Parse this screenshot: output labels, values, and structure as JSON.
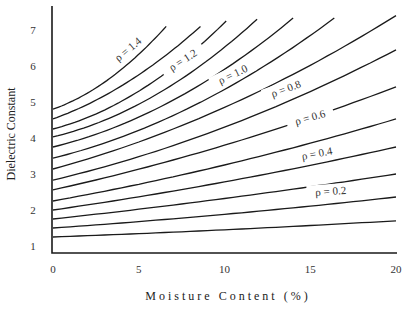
{
  "chart_data": {
    "type": "line",
    "title": "",
    "xlabel": "Moisture Content (%)",
    "ylabel": "Dielectric Constant",
    "xlim": [
      0,
      20
    ],
    "ylim": [
      1,
      7.5
    ],
    "x_ticks": [
      0,
      5,
      10,
      15,
      20
    ],
    "y_ticks": [
      1,
      2,
      3,
      4,
      5,
      6,
      7
    ],
    "grid": false,
    "legend": "none (curves labeled inline)",
    "series": [
      {
        "name": "ρ = 1.4",
        "labeled": true,
        "points": [
          [
            0,
            4.8
          ],
          [
            3,
            5.55
          ],
          [
            6.6,
            7.1
          ]
        ]
      },
      {
        "name": "ρ = 1.3",
        "labeled": false,
        "points": [
          [
            0,
            4.53
          ],
          [
            4,
            5.45
          ],
          [
            8.6,
            7.1
          ]
        ]
      },
      {
        "name": "ρ = 1.2",
        "labeled": true,
        "points": [
          [
            0,
            4.25
          ],
          [
            5,
            5.3
          ],
          [
            10.1,
            7.25
          ]
        ]
      },
      {
        "name": "ρ = 1.1",
        "labeled": false,
        "points": [
          [
            0,
            4.03
          ],
          [
            6,
            5.2
          ],
          [
            11.9,
            7.3
          ]
        ]
      },
      {
        "name": "ρ = 1.0",
        "labeled": true,
        "points": [
          [
            0,
            3.75
          ],
          [
            7,
            5.05
          ],
          [
            14.0,
            7.33
          ]
        ]
      },
      {
        "name": "ρ = 0.9",
        "labeled": false,
        "points": [
          [
            0,
            3.44
          ],
          [
            8,
            4.85
          ],
          [
            16.4,
            7.33
          ]
        ]
      },
      {
        "name": "ρ = 0.8",
        "labeled": true,
        "points": [
          [
            0,
            3.14
          ],
          [
            10,
            4.85
          ],
          [
            20,
            7.4
          ]
        ]
      },
      {
        "name": "ρ = 0.7",
        "labeled": false,
        "points": [
          [
            0,
            2.83
          ],
          [
            10,
            4.3
          ],
          [
            20,
            6.45
          ]
        ]
      },
      {
        "name": "ρ = 0.6",
        "labeled": true,
        "points": [
          [
            0,
            2.56
          ],
          [
            10,
            3.8
          ],
          [
            20,
            5.42
          ]
        ]
      },
      {
        "name": "ρ = 0.5",
        "labeled": false,
        "points": [
          [
            0,
            2.25
          ],
          [
            10,
            3.25
          ],
          [
            20,
            4.53
          ]
        ]
      },
      {
        "name": "ρ = 0.4",
        "labeled": true,
        "points": [
          [
            0,
            2.0
          ],
          [
            10,
            2.78
          ],
          [
            20,
            3.75
          ]
        ]
      },
      {
        "name": "ρ = 0.3",
        "labeled": false,
        "points": [
          [
            0,
            1.75
          ],
          [
            10,
            2.32
          ],
          [
            20,
            3.0
          ]
        ]
      },
      {
        "name": "ρ = 0.2",
        "labeled": true,
        "points": [
          [
            0,
            1.5
          ],
          [
            10,
            1.88
          ],
          [
            20,
            2.36
          ]
        ]
      },
      {
        "name": "ρ = 0.1",
        "labeled": false,
        "points": [
          [
            0,
            1.25
          ],
          [
            10,
            1.45
          ],
          [
            20,
            1.7
          ]
        ]
      }
    ],
    "annotations": [
      {
        "text": "ρ = 1.4",
        "x": 4.4,
        "y": 6.45,
        "angle": -40
      },
      {
        "text": "ρ = 1.2",
        "x": 7.6,
        "y": 6.15,
        "angle": -33
      },
      {
        "text": "ρ = 1.0",
        "x": 10.5,
        "y": 5.75,
        "angle": -26
      },
      {
        "text": "ρ = 0.8",
        "x": 13.6,
        "y": 5.35,
        "angle": -20
      },
      {
        "text": "ρ = 0.6",
        "x": 15.0,
        "y": 4.55,
        "angle": -16
      },
      {
        "text": "ρ = 0.4",
        "x": 15.4,
        "y": 3.55,
        "angle": -11
      },
      {
        "text": "ρ = 0.2",
        "x": 16.2,
        "y": 2.5,
        "angle": -4
      }
    ]
  },
  "axes": {
    "x_title": "Moisture Content (%)",
    "y_title": "Dielectric Constant",
    "x_tick_labels": [
      "0",
      "5",
      "10",
      "15",
      "20"
    ],
    "y_tick_labels": [
      "1",
      "2",
      "3",
      "4",
      "5",
      "6",
      "7"
    ]
  }
}
